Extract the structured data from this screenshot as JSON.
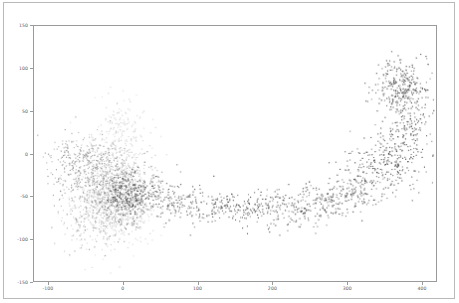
{
  "figure": {
    "background_color": "#ffffff",
    "frame_color": "#9a9a9a",
    "outer_border_color": "#b9b9b9",
    "title": "",
    "xlabel": "",
    "ylabel": ""
  },
  "chart_data": {
    "type": "scatter",
    "title": "",
    "xlabel": "",
    "ylabel": "",
    "xlim": [
      -120,
      420
    ],
    "ylim": [
      -150,
      150
    ],
    "xticks": [
      -100,
      0,
      100,
      200,
      300,
      400
    ],
    "xticklabels": [
      "-100",
      "0",
      "100",
      "200",
      "300",
      "400"
    ],
    "yticks": [
      -150,
      -100,
      -50,
      0,
      50,
      100,
      150
    ],
    "yticklabels": [
      "-150",
      "-100",
      "-50",
      "0",
      "50",
      "100",
      "150"
    ],
    "grid": false,
    "legend": null,
    "marker": "point",
    "marker_size": 1.2,
    "series": [
      {
        "name": "cluster-light-gray",
        "color": "#c8c8c8",
        "n_points": 900,
        "centers": [
          {
            "x": -5,
            "y": 20,
            "sx": 18,
            "sy": 22,
            "weight": 0.22
          },
          {
            "x": -18,
            "y": -30,
            "sx": 26,
            "sy": 26,
            "weight": 0.3
          },
          {
            "x": -30,
            "y": -75,
            "sx": 26,
            "sy": 22,
            "weight": 0.26
          },
          {
            "x": 5,
            "y": -55,
            "sx": 22,
            "sy": 24,
            "weight": 0.22
          }
        ]
      },
      {
        "name": "cluster-medium-gray",
        "color": "#8f8f8f",
        "n_points": 950,
        "centers": [
          {
            "x": -62,
            "y": -12,
            "sx": 22,
            "sy": 18,
            "weight": 0.26
          },
          {
            "x": -30,
            "y": -28,
            "sx": 22,
            "sy": 20,
            "weight": 0.24
          },
          {
            "x": -5,
            "y": -48,
            "sx": 20,
            "sy": 20,
            "weight": 0.26
          },
          {
            "x": -40,
            "y": -62,
            "sx": 24,
            "sy": 22,
            "weight": 0.24
          }
        ]
      },
      {
        "name": "cluster-dark",
        "color": "#3b3b3b",
        "n_points": 1700,
        "centers": [
          {
            "x": 5,
            "y": -50,
            "sx": 16,
            "sy": 16,
            "weight": 0.14
          },
          {
            "x": 40,
            "y": -45,
            "sx": 18,
            "sy": 14,
            "weight": 0.07
          },
          {
            "x": 80,
            "y": -60,
            "sx": 20,
            "sy": 12,
            "weight": 0.05
          },
          {
            "x": 130,
            "y": -62,
            "sx": 20,
            "sy": 10,
            "weight": 0.05
          },
          {
            "x": 175,
            "y": -66,
            "sx": 18,
            "sy": 10,
            "weight": 0.06
          },
          {
            "x": 215,
            "y": -62,
            "sx": 18,
            "sy": 12,
            "weight": 0.06
          },
          {
            "x": 258,
            "y": -60,
            "sx": 18,
            "sy": 12,
            "weight": 0.06
          },
          {
            "x": 295,
            "y": -50,
            "sx": 16,
            "sy": 14,
            "weight": 0.06
          },
          {
            "x": 325,
            "y": -30,
            "sx": 18,
            "sy": 16,
            "weight": 0.09
          },
          {
            "x": 360,
            "y": -8,
            "sx": 20,
            "sy": 18,
            "weight": 0.12
          },
          {
            "x": 385,
            "y": 35,
            "sx": 14,
            "sy": 18,
            "weight": 0.06
          },
          {
            "x": 372,
            "y": 78,
            "sx": 18,
            "sy": 16,
            "weight": 0.18
          }
        ]
      }
    ]
  }
}
